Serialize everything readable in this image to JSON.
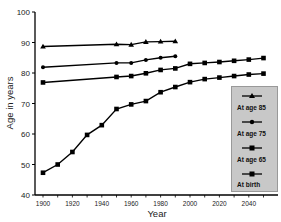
{
  "chart_data": {
    "type": "line",
    "title": "",
    "xlabel": "Year",
    "ylabel": "Age in years",
    "xlim": [
      1895,
      2055
    ],
    "ylim": [
      40,
      100
    ],
    "x_ticks": [
      "1900",
      "1920",
      "1940",
      "1960",
      "1980",
      "2000",
      "2020",
      "2040"
    ],
    "y_ticks": [
      "40",
      "50",
      "60",
      "70",
      "80",
      "90",
      "100"
    ],
    "grid": false,
    "legend_position": "right-inside",
    "series": [
      {
        "name": "At age 85",
        "marker": "triangle",
        "x": [
          1900,
          1950,
          1960,
          1970,
          1980,
          1990
        ],
        "values": [
          88.7,
          89.4,
          89.3,
          90.2,
          90.3,
          90.4
        ]
      },
      {
        "name": "At age 75",
        "marker": "circle",
        "x": [
          1900,
          1950,
          1960,
          1970,
          1980,
          1990
        ],
        "values": [
          81.9,
          83.3,
          83.3,
          84.3,
          85.0,
          85.5
        ]
      },
      {
        "name": "At age 65",
        "marker": "square",
        "x": [
          1900,
          1950,
          1960,
          1970,
          1980,
          1990,
          2000,
          2010,
          2020,
          2030,
          2040,
          2050
        ],
        "values": [
          76.9,
          78.7,
          79.0,
          79.9,
          81.0,
          81.5,
          83.0,
          83.3,
          83.6,
          84.0,
          84.4,
          84.9
        ]
      },
      {
        "name": "At birth",
        "marker": "square",
        "x": [
          1900,
          1910,
          1920,
          1930,
          1940,
          1950,
          1960,
          1970,
          1980,
          1990,
          2000,
          2010,
          2020,
          2030,
          2040,
          2050
        ],
        "values": [
          47.3,
          50.0,
          54.1,
          59.7,
          62.9,
          68.2,
          69.7,
          70.8,
          73.7,
          75.4,
          77.0,
          78.0,
          78.5,
          79.0,
          79.5,
          79.8
        ]
      }
    ]
  },
  "legend": {
    "items": [
      {
        "label": "At age 85"
      },
      {
        "label": "At age 75"
      },
      {
        "label": "At age 65"
      },
      {
        "label": "At birth"
      }
    ]
  }
}
